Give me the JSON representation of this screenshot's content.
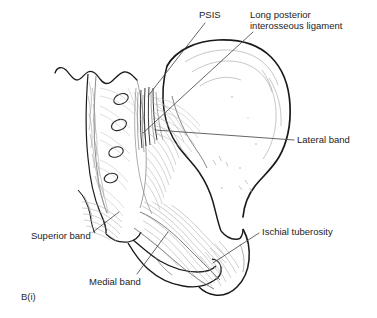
{
  "figure": {
    "panel_label": "B(i)",
    "style": "line-drawing",
    "colors": {
      "outline": "#1a1a1a",
      "fiber": "#8d8d8d",
      "fiber_light": "#b9b9b9",
      "leader": "#4a4a4a",
      "text": "#1c1c1c",
      "background": "#ffffff"
    }
  },
  "labels": {
    "psis": "PSIS",
    "long_posterior_line1": "Long posterior",
    "long_posterior_line2": "interosseous ligament",
    "lateral_band": "Lateral band",
    "ischial_tuberosity": "Ischial tuberosity",
    "superior_band": "Superior band",
    "medial_band": "Medial band"
  },
  "structures": [
    {
      "name": "sacrum",
      "note": "median crest with wavy superior edge"
    },
    {
      "name": "posterior-sacral-foramina",
      "count": 4
    },
    {
      "name": "ilium",
      "note": "gluteal surface, iliac crest"
    },
    {
      "name": "coccyx"
    },
    {
      "name": "ischial-tuberosity"
    },
    {
      "name": "greater-sciatic-notch"
    },
    {
      "name": "sacrotuberous-ligament"
    },
    {
      "name": "long-posterior-sacroiliac-ligament"
    }
  ]
}
